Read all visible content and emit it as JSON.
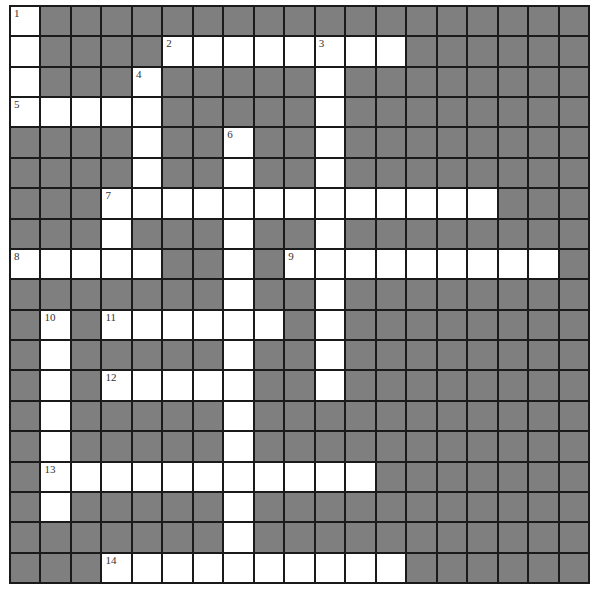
{
  "puzzle": {
    "rows": 19,
    "cols": 19,
    "colors": {
      "block": "#7f7f7f",
      "open": "#ffffff",
      "line": "#1a1a1a"
    },
    "open_cells": {
      "0": [
        0
      ],
      "1": [
        0,
        5,
        6,
        7,
        8,
        9,
        10,
        11,
        12
      ],
      "2": [
        0,
        4,
        10
      ],
      "3": [
        0,
        1,
        2,
        3,
        4,
        10
      ],
      "4": [
        4,
        7,
        10
      ],
      "5": [
        4,
        7,
        10
      ],
      "6": [
        3,
        4,
        5,
        6,
        7,
        8,
        9,
        10,
        11,
        12,
        13,
        14,
        15
      ],
      "7": [
        3,
        7,
        10
      ],
      "8": [
        0,
        1,
        2,
        3,
        4,
        7,
        9,
        10,
        11,
        12,
        13,
        14,
        15,
        16,
        17
      ],
      "9": [
        7,
        10
      ],
      "10": [
        1,
        3,
        4,
        5,
        6,
        7,
        8,
        10
      ],
      "11": [
        1,
        7,
        10
      ],
      "12": [
        1,
        3,
        4,
        5,
        6,
        7,
        10
      ],
      "13": [
        1,
        7
      ],
      "14": [
        1,
        7
      ],
      "15": [
        1,
        2,
        3,
        4,
        5,
        6,
        7,
        8,
        9,
        10,
        11
      ],
      "16": [
        1,
        7
      ],
      "17": [
        7
      ],
      "18": [
        3,
        4,
        5,
        6,
        7,
        8,
        9,
        10,
        11,
        12
      ]
    },
    "numbers": [
      {
        "label": "1",
        "row": 0,
        "col": 0
      },
      {
        "label": "2",
        "row": 1,
        "col": 5
      },
      {
        "label": "3",
        "row": 1,
        "col": 10
      },
      {
        "label": "4",
        "row": 2,
        "col": 4
      },
      {
        "label": "5",
        "row": 3,
        "col": 0
      },
      {
        "label": "6",
        "row": 4,
        "col": 7
      },
      {
        "label": "7",
        "row": 6,
        "col": 3
      },
      {
        "label": "8",
        "row": 8,
        "col": 0
      },
      {
        "label": "9",
        "row": 8,
        "col": 9
      },
      {
        "label": "10",
        "row": 10,
        "col": 1
      },
      {
        "label": "11",
        "row": 10,
        "col": 3
      },
      {
        "label": "12",
        "row": 12,
        "col": 3
      },
      {
        "label": "13",
        "row": 15,
        "col": 1
      },
      {
        "label": "14",
        "row": 18,
        "col": 3
      }
    ]
  }
}
